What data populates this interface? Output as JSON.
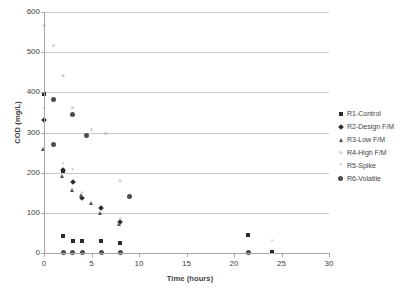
{
  "chart_data": {
    "type": "scatter",
    "title": "",
    "xlabel": "Time (hours)",
    "ylabel": "COD (mg/L)",
    "xlim": [
      0,
      30
    ],
    "ylim": [
      0,
      600
    ],
    "xticks": [
      0,
      5,
      10,
      15,
      20,
      25,
      30
    ],
    "yticks": [
      0,
      100,
      200,
      300,
      400,
      500,
      600
    ],
    "grid": "horizontal",
    "legend_position": "right",
    "series": [
      {
        "name": "R1-Control",
        "marker": "square",
        "color": "#2b2b2b",
        "points": [
          {
            "x": 0,
            "y": 397
          },
          {
            "x": 2,
            "y": 205
          },
          {
            "x": 2,
            "y": 43
          },
          {
            "x": 3,
            "y": 31
          },
          {
            "x": 4,
            "y": 31
          },
          {
            "x": 6,
            "y": 31
          },
          {
            "x": 8,
            "y": 26
          },
          {
            "x": 21.5,
            "y": 45
          },
          {
            "x": 24,
            "y": 2
          }
        ]
      },
      {
        "name": "R2-Design F/M",
        "marker": "diamond",
        "color": "#2b2b2b",
        "points": [
          {
            "x": 0,
            "y": 330
          },
          {
            "x": 2,
            "y": 207
          },
          {
            "x": 3,
            "y": 178
          },
          {
            "x": 4,
            "y": 137
          },
          {
            "x": 6,
            "y": 113
          },
          {
            "x": 8,
            "y": 77
          }
        ]
      },
      {
        "name": "R3-Low F/M",
        "marker": "triangle",
        "color": "#555555",
        "points": [
          {
            "x": 0,
            "y": 256
          },
          {
            "x": 2,
            "y": 189
          },
          {
            "x": 3,
            "y": 156
          },
          {
            "x": 4,
            "y": 142
          },
          {
            "x": 5,
            "y": 122
          },
          {
            "x": 6,
            "y": 97
          },
          {
            "x": 8,
            "y": 71
          }
        ]
      },
      {
        "name": "R4-High F/M",
        "marker": "x",
        "color": "#b0b0b0",
        "points": [
          {
            "x": 0,
            "y": 566
          },
          {
            "x": 1,
            "y": 515
          },
          {
            "x": 2,
            "y": 440
          },
          {
            "x": 3,
            "y": 362
          },
          {
            "x": 5,
            "y": 306
          },
          {
            "x": 6.5,
            "y": 297
          },
          {
            "x": 8,
            "y": 179
          }
        ]
      },
      {
        "name": "R5-Spike",
        "marker": "star",
        "color": "#b8b8b8",
        "points": [
          {
            "x": 0,
            "y": 356
          },
          {
            "x": 2,
            "y": 219
          },
          {
            "x": 3,
            "y": 203
          },
          {
            "x": 4,
            "y": 146
          },
          {
            "x": 8,
            "y": 82
          },
          {
            "x": 24,
            "y": 25
          }
        ]
      },
      {
        "name": "R6-Volatile",
        "marker": "circle",
        "color": "#4d4d4d",
        "points": [
          {
            "x": 1,
            "y": 381
          },
          {
            "x": 3,
            "y": 344
          },
          {
            "x": 4.5,
            "y": 293
          },
          {
            "x": 1,
            "y": 270
          },
          {
            "x": 9,
            "y": 140
          },
          {
            "x": 2,
            "y": 2
          },
          {
            "x": 3,
            "y": 2
          },
          {
            "x": 4,
            "y": 2
          },
          {
            "x": 6,
            "y": 2
          },
          {
            "x": 8,
            "y": 2
          },
          {
            "x": 21.5,
            "y": 2
          }
        ]
      }
    ]
  },
  "axes": {
    "y_title": "COD (mg/L)",
    "x_title": "Time (hours)",
    "y_tick_labels": [
      "600",
      "500",
      "400",
      "300",
      "200",
      "100",
      "0"
    ],
    "x_tick_labels": [
      "0",
      "5",
      "10",
      "15",
      "20",
      "25",
      "30"
    ]
  },
  "legend": {
    "items": [
      {
        "label": "R1-Control",
        "marker": "square"
      },
      {
        "label": "R2-Design F/M",
        "marker": "diamond"
      },
      {
        "label": "R3-Low F/M",
        "marker": "triangle"
      },
      {
        "label": "R4-High F/M",
        "marker": "x"
      },
      {
        "label": "R5-Spike",
        "marker": "star"
      },
      {
        "label": "R6-Volatile",
        "marker": "circle"
      }
    ]
  }
}
